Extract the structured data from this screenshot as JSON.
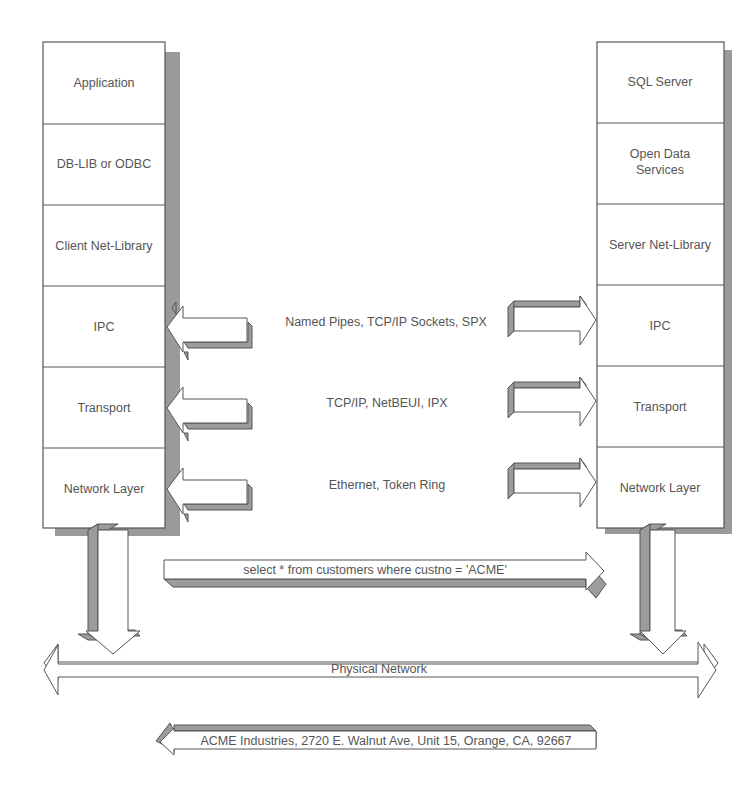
{
  "client_stack": {
    "layers": [
      {
        "label": "Application"
      },
      {
        "label": "DB-LIB or ODBC"
      },
      {
        "label": "Client Net-Library"
      },
      {
        "label": "IPC"
      },
      {
        "label": "Transport"
      },
      {
        "label": "Network Layer"
      }
    ]
  },
  "server_stack": {
    "layers": [
      {
        "label": "SQL Server"
      },
      {
        "label_line1": "Open Data",
        "label_line2": "Services"
      },
      {
        "label": "Server Net-Library"
      },
      {
        "label": "IPC"
      },
      {
        "label": "Transport"
      },
      {
        "label": "Network Layer"
      }
    ]
  },
  "protocols": [
    {
      "layer": "IPC",
      "label": "Named Pipes, TCP/IP Sockets, SPX"
    },
    {
      "layer": "Transport",
      "label": "TCP/IP, NetBEUI, IPX"
    },
    {
      "layer": "Network Layer",
      "label": "Ethernet, Token Ring"
    }
  ],
  "request": {
    "label": "select * from customers where custno = 'ACME'"
  },
  "network": {
    "label": "Physical Network"
  },
  "response": {
    "label": "ACME Industries, 2720 E. Walnut Ave, Unit 15, Orange, CA, 92667"
  },
  "colors": {
    "border": "#555555",
    "shadow": "#9a9a9a",
    "text": "#555555",
    "fill": "#ffffff"
  }
}
